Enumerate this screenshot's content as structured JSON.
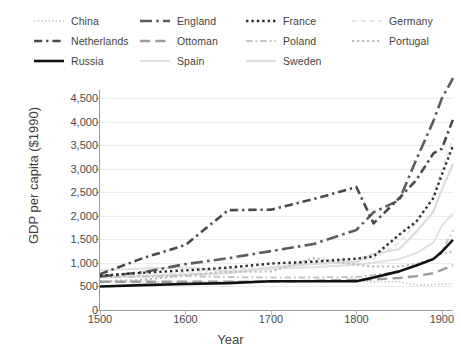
{
  "chart_data": {
    "type": "line",
    "title": "",
    "xlabel": "Year",
    "ylabel": "GDP per capita ($1990)",
    "xlim": [
      1500,
      1913
    ],
    "ylim": [
      0,
      4500
    ],
    "xticks": [
      1500,
      1600,
      1700,
      1800,
      1900
    ],
    "yticks": [
      0,
      500,
      1000,
      1500,
      2000,
      2500,
      3000,
      3500,
      4000,
      4500
    ],
    "ytick_labels": [
      "0",
      "500",
      "1,000",
      "1,500",
      "2,000",
      "2,500",
      "3,000",
      "3,500",
      "4,000",
      "4,500"
    ],
    "xtick_labels": [
      "1500",
      "1600",
      "1700",
      "1800",
      "1900"
    ],
    "grid": "horizontal",
    "legend_position": "top",
    "legend_columns": 4,
    "x": [
      1500,
      1550,
      1600,
      1650,
      1700,
      1750,
      1800,
      1820,
      1850,
      1870,
      1890,
      1900,
      1913
    ],
    "series": [
      {
        "name": "China",
        "color": "#c9c9c9",
        "dash": "dotted",
        "width": 1.6,
        "values": [
          600,
          600,
          600,
          600,
          600,
          600,
          600,
          600,
          600,
          530,
          540,
          545,
          552
        ]
      },
      {
        "name": "Netherlands",
        "color": "#4a4a4a",
        "dash": "dash-dot",
        "width": 2.6,
        "values": [
          761,
          1100,
          1381,
          2120,
          2130,
          2355,
          2609,
          1838,
          2371,
          2757,
          3323,
          3424,
          4049
        ]
      },
      {
        "name": "Russia",
        "color": "#111111",
        "dash": "solid",
        "width": 2.6,
        "values": [
          499,
          527,
          552,
          570,
          610,
          610,
          610,
          688,
          820,
          943,
          1080,
          1237,
          1488
        ]
      },
      {
        "name": "England",
        "color": "#5c5c5c",
        "dash": "long-dash-dot",
        "width": 2.6,
        "values": [
          714,
          800,
          974,
          1100,
          1250,
          1400,
          1700,
          2074,
          2330,
          3190,
          4009,
          4492,
          4921
        ]
      },
      {
        "name": "Ottoman",
        "color": "#9c9c9c",
        "dash": "long-dash",
        "width": 2.4,
        "values": [
          600,
          600,
          600,
          600,
          600,
          620,
          640,
          650,
          680,
          720,
          780,
          850,
          950
        ]
      },
      {
        "name": "Spain",
        "color": "#e0e0e0",
        "dash": "solid",
        "width": 2.0,
        "values": [
          846,
          880,
          900,
          820,
          880,
          910,
          962,
          1008,
          1079,
          1207,
          1430,
          1786,
          2056
        ]
      },
      {
        "name": "France",
        "color": "#2e2e2e",
        "dash": "dotted",
        "width": 2.4,
        "values": [
          727,
          790,
          841,
          900,
          986,
          1026,
          1090,
          1135,
          1597,
          1876,
          2376,
          2876,
          3485
        ]
      },
      {
        "name": "Poland",
        "color": "#c4c4c4",
        "dash": "dash-dot",
        "width": 2.0,
        "values": [
          700,
          710,
          720,
          700,
          690,
          690,
          700,
          740,
          820,
          946,
          1100,
          1250,
          1690
        ]
      },
      {
        "name": "Sweden",
        "color": "#dcdcdc",
        "dash": "solid",
        "width": 2.2,
        "values": [
          695,
          720,
          750,
          780,
          900,
          980,
          1020,
          1198,
          1289,
          1662,
          2086,
          2561,
          3096
        ]
      },
      {
        "name": "Germany",
        "color": "#e6e6e6",
        "dash": "dashed",
        "width": 2.0,
        "values": [
          688,
          720,
          791,
          870,
          910,
          1000,
          1077,
          1077,
          1428,
          1839,
          2428,
          2985,
          3648
        ]
      },
      {
        "name": "Portugal",
        "color": "#bdbdbd",
        "dash": "dotted",
        "width": 2.2,
        "values": [
          606,
          640,
          740,
          810,
          819,
          1100,
          963,
          923,
          923,
          975,
          1100,
          1200,
          1244
        ]
      }
    ]
  },
  "legend": {
    "rows": [
      [
        {
          "name": "China",
          "label": "China"
        },
        {
          "name": "England",
          "label": "England"
        },
        {
          "name": "France",
          "label": "France"
        },
        {
          "name": "Germany",
          "label": "Germany"
        }
      ],
      [
        {
          "name": "Netherlands",
          "label": "Netherlands"
        },
        {
          "name": "Ottoman",
          "label": "Ottoman"
        },
        {
          "name": "Poland",
          "label": "Poland"
        },
        {
          "name": "Portugal",
          "label": "Portugal"
        }
      ],
      [
        {
          "name": "Russia",
          "label": "Russia"
        },
        {
          "name": "Spain",
          "label": "Spain"
        },
        {
          "name": "Sweden",
          "label": "Sweden"
        }
      ]
    ]
  }
}
